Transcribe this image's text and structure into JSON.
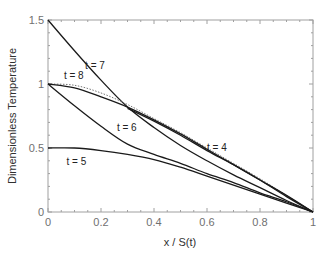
{
  "chart_data": {
    "type": "line",
    "title": "",
    "xlabel": "x / S(t)",
    "ylabel": "Dimensionless Temperature",
    "xlim": [
      0,
      1
    ],
    "ylim": [
      0,
      1.5
    ],
    "xticks": [
      0,
      0.2,
      0.4,
      0.6,
      0.8,
      1
    ],
    "xtick_labels": [
      "0",
      "0.2",
      "0.4",
      "0.6",
      "0.8",
      "1"
    ],
    "yticks": [
      0,
      0.5,
      1,
      1.5
    ],
    "ytick_labels": [
      "0",
      "0.5",
      "1",
      "1.5"
    ],
    "grid": false,
    "legend": "none (inline annotations)",
    "series": [
      {
        "name": "t = 7",
        "style": "solid",
        "x": [
          0,
          0.1,
          0.2,
          0.3,
          0.4,
          0.5,
          0.6,
          0.7,
          0.8,
          0.9,
          1.0
        ],
        "y": [
          1.5,
          1.26,
          1.03,
          0.82,
          0.66,
          0.52,
          0.4,
          0.29,
          0.19,
          0.09,
          0
        ]
      },
      {
        "name": "t = 8",
        "style": "dotted",
        "x": [
          0,
          0.1,
          0.2,
          0.3,
          0.4,
          0.5,
          0.6,
          0.7,
          0.8,
          0.9,
          1.0
        ],
        "y": [
          1.0,
          0.99,
          0.93,
          0.84,
          0.73,
          0.62,
          0.5,
          0.38,
          0.26,
          0.13,
          0
        ]
      },
      {
        "name": "t = 8 (solid)",
        "style": "solid",
        "x": [
          0,
          0.1,
          0.2,
          0.3,
          0.4,
          0.5,
          0.6,
          0.7,
          0.8,
          0.9,
          1.0
        ],
        "y": [
          1.0,
          0.97,
          0.9,
          0.82,
          0.72,
          0.61,
          0.49,
          0.37,
          0.25,
          0.13,
          0
        ]
      },
      {
        "name": "t = 4",
        "style": "solid",
        "x": [
          0.3,
          0.4,
          0.5,
          0.6,
          0.7,
          0.8,
          0.9,
          1.0
        ],
        "y": [
          0.81,
          0.71,
          0.6,
          0.48,
          0.37,
          0.25,
          0.12,
          0
        ]
      },
      {
        "name": "t = 6",
        "style": "solid",
        "x": [
          0,
          0.1,
          0.2,
          0.3,
          0.4,
          0.5,
          0.6,
          0.7,
          0.8,
          0.9,
          1.0
        ],
        "y": [
          1.0,
          0.83,
          0.67,
          0.53,
          0.45,
          0.38,
          0.3,
          0.23,
          0.15,
          0.08,
          0
        ]
      },
      {
        "name": "t = 5",
        "style": "solid",
        "x": [
          0,
          0.1,
          0.2,
          0.3,
          0.4,
          0.5,
          0.6,
          0.7,
          0.8,
          0.9,
          1.0
        ],
        "y": [
          0.5,
          0.5,
          0.48,
          0.45,
          0.41,
          0.35,
          0.28,
          0.21,
          0.14,
          0.07,
          0
        ]
      }
    ],
    "annotations": [
      {
        "text": "t = 7",
        "x": 0.14,
        "y": 1.12
      },
      {
        "text": "t = 8",
        "x": 0.06,
        "y": 1.04
      },
      {
        "text": "t = 6",
        "x": 0.26,
        "y": 0.63
      },
      {
        "text": "t = 5",
        "x": 0.07,
        "y": 0.37
      },
      {
        "text": "t = 4",
        "x": 0.6,
        "y": 0.48
      }
    ]
  }
}
